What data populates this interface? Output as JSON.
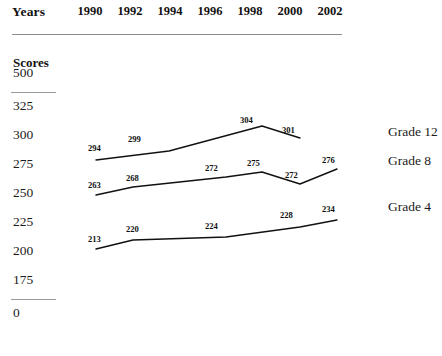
{
  "header": {
    "years_label": "Years",
    "scores_label": "Scores"
  },
  "chart_data": {
    "type": "line",
    "title": "",
    "subtitle": "",
    "xlabel": "Years",
    "ylabel": "Scores",
    "grid": false,
    "legend_position": "right-inline",
    "axis_break": true,
    "x": [
      1990,
      1992,
      1994,
      1996,
      1998,
      2000,
      2002
    ],
    "categories": [
      "1990",
      "1992",
      "1994",
      "1996",
      "1998",
      "2000",
      "2002"
    ],
    "ytick_labels": [
      "500",
      "325",
      "300",
      "275",
      "250",
      "225",
      "200",
      "175",
      "0"
    ],
    "ylim": [
      0,
      500
    ],
    "series": [
      {
        "name": "Grade 12",
        "x": [
          1990,
          1994,
          1998,
          2000
        ],
        "values": [
          294,
          299,
          304,
          301
        ],
        "labels": [
          "294",
          "299",
          "304",
          "301"
        ]
      },
      {
        "name": "Grade 8",
        "x": [
          1990,
          1992,
          1996,
          1998,
          2000,
          2002
        ],
        "values": [
          263,
          268,
          272,
          275,
          272,
          276
        ],
        "labels": [
          "263",
          "268",
          "272",
          "275",
          "272",
          "276"
        ]
      },
      {
        "name": "Grade 4",
        "x": [
          1990,
          1992,
          1996,
          2000,
          2002
        ],
        "values": [
          213,
          220,
          224,
          228,
          234
        ],
        "labels": [
          "213",
          "220",
          "224",
          "228",
          "234"
        ]
      }
    ]
  },
  "geometry": {
    "year_head_x": [
      90,
      130,
      170,
      210,
      250,
      290,
      330
    ],
    "ytick_y": [
      74,
      107,
      136,
      165,
      194,
      223,
      252,
      281,
      314
    ],
    "axis_break_y": [
      92,
      299
    ],
    "series_paths": [
      "M 96 160 L 169 151 L 262 126 L 300 138",
      "M 96 195 L 133 187 L 226 177 L 262 172 L 300 184 L 337 169",
      "M 96 249 L 133 240 L 226 237 L 300 227 L 337 220"
    ],
    "point_labels": [
      {
        "text": "294",
        "x": 88,
        "y": 143
      },
      {
        "text": "299",
        "x": 128,
        "y": 134
      },
      {
        "text": "304",
        "x": 240,
        "y": 115
      },
      {
        "text": "301",
        "x": 282,
        "y": 125
      },
      {
        "text": "263",
        "x": 88,
        "y": 180
      },
      {
        "text": "268",
        "x": 126,
        "y": 173
      },
      {
        "text": "272",
        "x": 205,
        "y": 163
      },
      {
        "text": "275",
        "x": 247,
        "y": 158
      },
      {
        "text": "272",
        "x": 285,
        "y": 170
      },
      {
        "text": "276",
        "x": 322,
        "y": 155
      },
      {
        "text": "213",
        "x": 88,
        "y": 234
      },
      {
        "text": "220",
        "x": 126,
        "y": 224
      },
      {
        "text": "224",
        "x": 205,
        "y": 221
      },
      {
        "text": "228",
        "x": 280,
        "y": 210
      },
      {
        "text": "234",
        "x": 322,
        "y": 204
      }
    ],
    "series_label_pos": [
      {
        "x": 388,
        "y": 133
      },
      {
        "x": 388,
        "y": 162
      },
      {
        "x": 388,
        "y": 208
      }
    ]
  }
}
